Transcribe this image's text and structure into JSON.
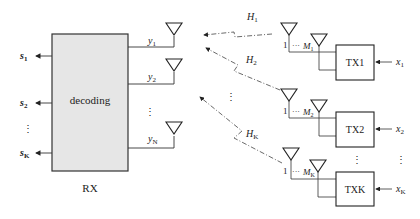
{
  "receiver": {
    "label": "RX",
    "block_label": "decoding",
    "outputs": [
      {
        "label": "s",
        "sub": "1"
      },
      {
        "label": "s",
        "sub": "2"
      },
      {
        "label": "s",
        "sub": "K"
      }
    ],
    "outputs_ellipsis": "⋮",
    "antenna_signals": [
      {
        "label": "y",
        "sub": "1"
      },
      {
        "label": "y",
        "sub": "2"
      },
      {
        "label": "y",
        "sub": "N"
      }
    ],
    "antenna_ellipsis": "⋮"
  },
  "channels": [
    {
      "label": "H",
      "sub": "1"
    },
    {
      "label": "H",
      "sub": "2"
    },
    {
      "label": "H",
      "sub": "K"
    }
  ],
  "channels_ellipsis": "⋮",
  "transmitters": [
    {
      "label": "TX1",
      "input": "x",
      "input_sub": "1",
      "ant_first": "1",
      "ant_dots": "···",
      "ant_last": "M",
      "ant_last_sub": "1"
    },
    {
      "label": "TX2",
      "input": "x",
      "input_sub": "2",
      "ant_first": "1",
      "ant_dots": "···",
      "ant_last": "M",
      "ant_last_sub": "2"
    },
    {
      "label": "TXK",
      "input": "x",
      "input_sub": "K",
      "ant_first": "1",
      "ant_dots": "···",
      "ant_last": "M",
      "ant_last_sub": "K"
    }
  ],
  "transmitters_ellipsis": "⋮",
  "inputs_ellipsis": "⋮"
}
